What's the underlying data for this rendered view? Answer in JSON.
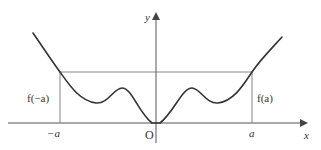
{
  "figure": {
    "colors": {
      "axis": "#555555",
      "curve": "#333333",
      "guide": "#777777",
      "text": "#333333"
    },
    "axes": {
      "x_label": "x",
      "y_label": "y",
      "origin_label": "O"
    },
    "ticks": {
      "neg_a": "−a",
      "pos_a": "a"
    },
    "annotations": {
      "f_neg_a": "f(−a)",
      "f_pos_a": "f(a)"
    }
  }
}
